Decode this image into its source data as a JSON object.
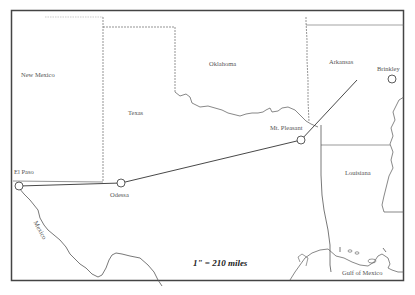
{
  "map": {
    "frame_color": "#333333",
    "route_color": "#333333",
    "states": [
      {
        "name": "New Mexico"
      },
      {
        "name": "Texas"
      },
      {
        "name": "Oklahoma"
      },
      {
        "name": "Arkansas"
      },
      {
        "name": "Louisiana"
      },
      {
        "name": "Mexico"
      }
    ],
    "water": {
      "name": "Gulf of Mexico"
    },
    "cities": [
      {
        "name": "El Paso"
      },
      {
        "name": "Odessa"
      },
      {
        "name": "Mt. Pleasant"
      },
      {
        "name": "Brinkley"
      }
    ],
    "scale": "1\" = 210 miles"
  }
}
